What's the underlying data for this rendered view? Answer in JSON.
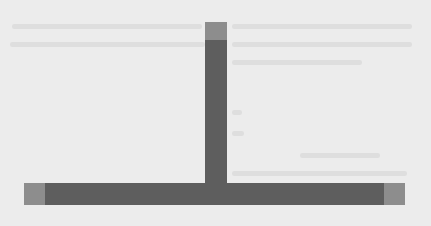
{
  "document": {
    "background_color": "#ececec",
    "text_legible": false,
    "ghost_text_lines": [
      {
        "x": 232,
        "y": 24,
        "w": 180
      },
      {
        "x": 12,
        "y": 24,
        "w": 190
      },
      {
        "x": 232,
        "y": 42,
        "w": 180
      },
      {
        "x": 10,
        "y": 42,
        "w": 195
      },
      {
        "x": 232,
        "y": 60,
        "w": 130
      },
      {
        "x": 232,
        "y": 110,
        "w": 10
      },
      {
        "x": 232,
        "y": 131,
        "w": 12
      },
      {
        "x": 300,
        "y": 153,
        "w": 80
      },
      {
        "x": 232,
        "y": 171,
        "w": 175
      }
    ]
  },
  "graphic": {
    "shape": "T-bar",
    "colors": {
      "dark": "#5e5e5e",
      "light": "#8d8d8d"
    },
    "vertical_bar": {
      "x": 205,
      "y": 22,
      "w": 22,
      "h": 172
    },
    "vertical_cap": {
      "x": 205,
      "y": 22,
      "w": 22,
      "h": 18
    },
    "horizontal_bar": {
      "x": 24,
      "y": 183,
      "w": 381,
      "h": 22
    },
    "left_cap": {
      "x": 24,
      "y": 183,
      "w": 21,
      "h": 22
    },
    "right_cap": {
      "x": 384,
      "y": 183,
      "w": 21,
      "h": 22
    }
  }
}
